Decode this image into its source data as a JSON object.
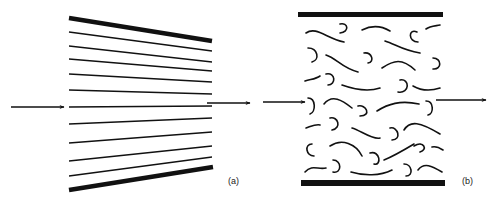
{
  "figure": {
    "panels": [
      {
        "id": "a",
        "label": "(a)",
        "description": "Converging straight parallel lines (oriented chains) between thick boundaries, arrow in and arrow out",
        "boundary_color": "#111111",
        "line_count": 11
      },
      {
        "id": "b",
        "label": "(b)",
        "description": "Randomly coiled short chains between two parallel thick bars, arrow in and arrow out",
        "boundary_color": "#111111",
        "coil_rows": 7
      }
    ],
    "arrows": [
      {
        "panel": "a",
        "role": "inflow-arrow"
      },
      {
        "panel": "a",
        "role": "outflow-arrow"
      },
      {
        "panel": "b",
        "role": "inflow-arrow"
      },
      {
        "panel": "b",
        "role": "outflow-arrow"
      }
    ]
  }
}
